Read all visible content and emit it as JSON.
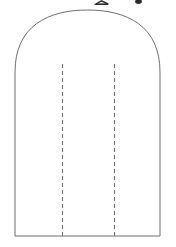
{
  "figure": {
    "name": "arch-shape-pattern-diagram",
    "background_color": "#ffffff",
    "outline": {
      "label": "arch-outline",
      "stroke_color": "#6f6f6f",
      "stroke_width": 1,
      "fill_color": "#ffffff",
      "left_x": 15,
      "right_x": 160,
      "bottom_y": 236,
      "apex_y": 10,
      "shoulder_y": 72,
      "path": "M 15 236 L 15 72 C 15 26 48 10 87.5 10 C 127 10 160 26 160 72 L 160 236 Z"
    },
    "fold_lines": [
      {
        "label": "left-fold-line",
        "x": 62.5,
        "y_top": 64,
        "y_bottom": 236,
        "stroke_color": "#707070",
        "stroke_width": 1.1,
        "dash_on": 4,
        "dash_off": 3
      },
      {
        "label": "right-fold-line",
        "x": 114.5,
        "y_top": 64,
        "y_bottom": 236,
        "stroke_color": "#707070",
        "stroke_width": 1.1,
        "dash_on": 4,
        "dash_off": 3
      }
    ],
    "clipped_marks": [
      {
        "label": "clipped-caret-mark",
        "x": 95,
        "y": 1,
        "width": 14,
        "height": 4,
        "color": "#2b2b2b"
      },
      {
        "label": "clipped-dot-mark",
        "x": 136,
        "y": 1,
        "width": 6,
        "height": 4,
        "color": "#2b2b2b"
      }
    ]
  },
  "canvas": {
    "width": 176,
    "height": 247
  }
}
